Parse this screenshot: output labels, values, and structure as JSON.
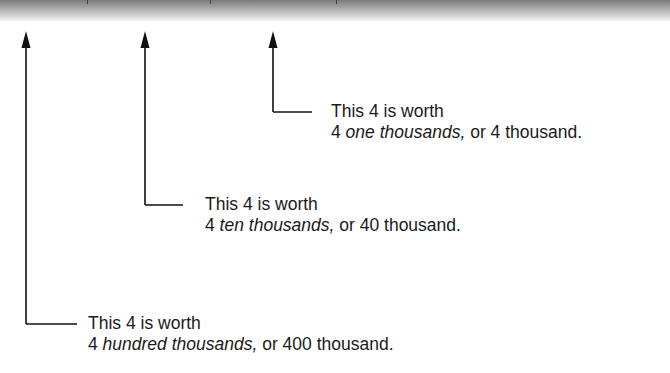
{
  "header_band": {
    "dividers_x": [
      87,
      210,
      336
    ]
  },
  "callouts": [
    {
      "id": "thousands",
      "arrow_x": 273,
      "elbow_y": 112,
      "line_end_x": 312,
      "text_x": 331,
      "line1": "This 4 is worth",
      "line2_prefix": "4 ",
      "line2_italic": "one thousands,",
      "line2_suffix": " or 4 thousand."
    },
    {
      "id": "ten-thousands",
      "arrow_x": 145,
      "elbow_y": 205,
      "line_end_x": 183,
      "text_x": 205,
      "line1": "This 4 is worth",
      "line2_prefix": "4 ",
      "line2_italic": "ten thousands,",
      "line2_suffix": " or 40 thousand."
    },
    {
      "id": "hundred-thousands",
      "arrow_x": 26,
      "elbow_y": 324,
      "line_end_x": 77,
      "text_x": 88,
      "line1": "This 4 is worth",
      "line2_prefix": "4 ",
      "line2_italic": "hundred thousands,",
      "line2_suffix": " or 400 thousand."
    }
  ],
  "colors": {
    "line": "#111111",
    "text": "#1a1a1a"
  }
}
